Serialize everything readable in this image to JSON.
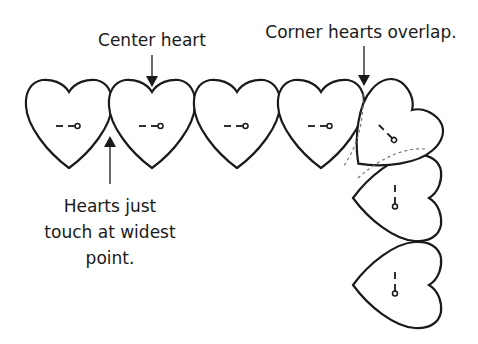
{
  "diagram": {
    "labels": {
      "center_heart": "Center heart",
      "corner_overlap": "Corner hearts overlap.",
      "touch_line1": "Hearts just",
      "touch_line2": "touch at widest",
      "touch_line3": "point."
    },
    "row_heart_count": 4,
    "corner_heart_count": 1,
    "column_heart_count": 2,
    "colors": {
      "stroke": "#1a1a1a",
      "dashed_guide": "#777777",
      "background": "#ffffff"
    }
  }
}
